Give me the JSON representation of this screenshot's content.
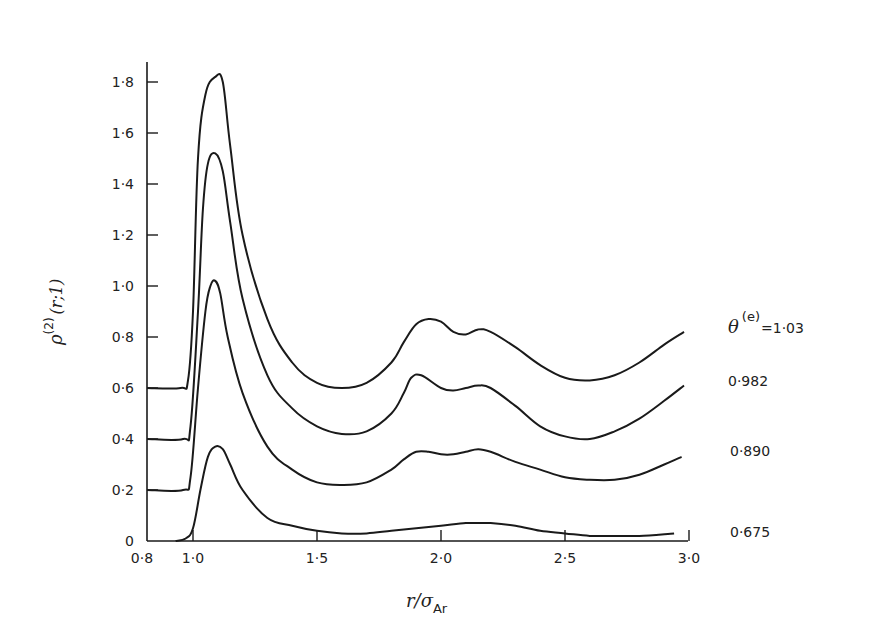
{
  "chart_data": {
    "type": "line",
    "title": "",
    "xlabel": "r/σ_Ar",
    "ylabel": "ρ^(2)(r;1)",
    "xlim": [
      0.8,
      3.0
    ],
    "ylim": [
      0,
      1.9
    ],
    "grid": false,
    "legend_position": "inline-right",
    "x_ticks": [
      "0·8",
      "1·0",
      "1·5",
      "2·0",
      "2·5",
      "3·0"
    ],
    "x_tick_values": [
      0.8,
      1.0,
      1.5,
      2.0,
      2.5,
      3.0
    ],
    "y_ticks": [
      "0",
      "0·2",
      "0·4",
      "0·6",
      "0·8",
      "1·0",
      "1·2",
      "1·4",
      "1·6",
      "1·8"
    ],
    "y_tick_values": [
      0,
      0.2,
      0.4,
      0.6,
      0.8,
      1.0,
      1.2,
      1.4,
      1.6,
      1.8
    ],
    "note": "Curves are vertically offset (plotted values include offset)",
    "series": [
      {
        "name": "θ(e)=1·03",
        "offset": 0.6,
        "x": [
          0.82,
          0.95,
          0.98,
          1.0,
          1.02,
          1.05,
          1.09,
          1.12,
          1.15,
          1.2,
          1.3,
          1.4,
          1.5,
          1.6,
          1.7,
          1.8,
          1.85,
          1.9,
          1.95,
          2.0,
          2.05,
          2.1,
          2.15,
          2.2,
          2.3,
          2.4,
          2.5,
          2.6,
          2.7,
          2.8,
          2.9,
          2.98
        ],
        "values": [
          0.6,
          0.6,
          0.63,
          0.9,
          1.5,
          1.75,
          1.82,
          1.8,
          1.55,
          1.2,
          0.87,
          0.7,
          0.62,
          0.6,
          0.62,
          0.7,
          0.78,
          0.85,
          0.87,
          0.86,
          0.82,
          0.81,
          0.83,
          0.82,
          0.76,
          0.69,
          0.64,
          0.63,
          0.65,
          0.7,
          0.77,
          0.82
        ]
      },
      {
        "name": "0·982",
        "offset": 0.4,
        "x": [
          0.82,
          0.96,
          0.99,
          1.02,
          1.04,
          1.06,
          1.09,
          1.12,
          1.15,
          1.2,
          1.3,
          1.4,
          1.5,
          1.6,
          1.7,
          1.8,
          1.85,
          1.88,
          1.92,
          2.0,
          2.05,
          2.1,
          2.15,
          2.2,
          2.3,
          2.4,
          2.5,
          2.6,
          2.7,
          2.8,
          2.9,
          2.98
        ],
        "values": [
          0.4,
          0.4,
          0.45,
          0.9,
          1.3,
          1.48,
          1.52,
          1.45,
          1.25,
          0.95,
          0.65,
          0.52,
          0.45,
          0.42,
          0.43,
          0.5,
          0.58,
          0.64,
          0.65,
          0.6,
          0.59,
          0.6,
          0.61,
          0.6,
          0.53,
          0.45,
          0.41,
          0.4,
          0.43,
          0.48,
          0.55,
          0.61
        ]
      },
      {
        "name": "0·890",
        "offset": 0.2,
        "x": [
          0.82,
          0.96,
          0.99,
          1.02,
          1.05,
          1.07,
          1.09,
          1.11,
          1.14,
          1.2,
          1.3,
          1.4,
          1.5,
          1.6,
          1.7,
          1.8,
          1.85,
          1.9,
          1.95,
          2.0,
          2.05,
          2.1,
          2.15,
          2.2,
          2.3,
          2.4,
          2.5,
          2.6,
          2.7,
          2.8,
          2.9,
          2.97
        ],
        "values": [
          0.2,
          0.2,
          0.25,
          0.6,
          0.9,
          1.0,
          1.02,
          0.97,
          0.8,
          0.58,
          0.37,
          0.28,
          0.23,
          0.22,
          0.23,
          0.28,
          0.32,
          0.35,
          0.35,
          0.34,
          0.34,
          0.35,
          0.36,
          0.35,
          0.31,
          0.28,
          0.25,
          0.24,
          0.24,
          0.26,
          0.3,
          0.33
        ]
      },
      {
        "name": "0·675",
        "offset": 0.0,
        "x": [
          0.93,
          0.97,
          1.0,
          1.03,
          1.06,
          1.09,
          1.12,
          1.15,
          1.2,
          1.3,
          1.4,
          1.5,
          1.6,
          1.7,
          1.8,
          1.9,
          2.0,
          2.1,
          2.15,
          2.2,
          2.3,
          2.4,
          2.5,
          2.6,
          2.7,
          2.8,
          2.94
        ],
        "values": [
          0.0,
          0.01,
          0.05,
          0.2,
          0.33,
          0.37,
          0.36,
          0.3,
          0.2,
          0.09,
          0.06,
          0.04,
          0.03,
          0.03,
          0.04,
          0.05,
          0.06,
          0.07,
          0.07,
          0.07,
          0.06,
          0.04,
          0.03,
          0.02,
          0.02,
          0.02,
          0.03
        ]
      }
    ]
  },
  "labels": {
    "ylabel_main": "ρ",
    "ylabel_sup": "(2)",
    "ylabel_args": "(r;1)",
    "xlabel_main": "r/σ",
    "xlabel_sub": "Ar",
    "theta_symbol": "θ",
    "theta_sup": "(e)",
    "theta_value": "=1·03",
    "series_labels": [
      "0·982",
      "0·890",
      "0·675"
    ]
  }
}
